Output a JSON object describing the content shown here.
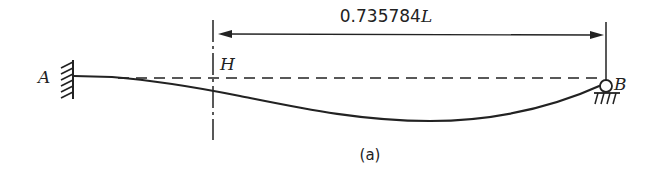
{
  "diagram": {
    "labels": {
      "support_a": "A",
      "support_b": "B",
      "section_h": "H",
      "dimension_value": "0.735784",
      "dimension_unit": "L",
      "caption": "(a)"
    },
    "elements": {
      "support_a_type": "fixed-wall",
      "support_b_type": "pin-roller",
      "beam_state": "deflected",
      "reference_line": "dashed",
      "section_line": "dash-dot"
    },
    "colors": {
      "stroke": "#222222",
      "background": "#ffffff"
    }
  }
}
